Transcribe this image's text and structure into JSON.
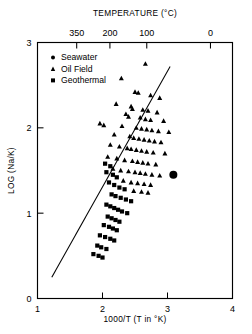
{
  "chart_data": {
    "type": "scatter",
    "title": "",
    "xlabel": "1000/T (T in °K)",
    "ylabel": "LOG (Na/K)",
    "top_axis_label": "TEMPERATURE (°C)",
    "xlim": [
      1,
      4
    ],
    "ylim": [
      0,
      3
    ],
    "grid": false,
    "legend_position": "top-left",
    "x_ticks": [
      {
        "value": 1,
        "label": "1"
      },
      {
        "value": 2,
        "label": "2"
      },
      {
        "value": 3,
        "label": "3"
      },
      {
        "value": 4,
        "label": "4"
      }
    ],
    "y_ticks": [
      {
        "value": 0,
        "label": "0"
      },
      {
        "value": 1,
        "label": "1"
      },
      {
        "value": 2,
        "label": "2"
      },
      {
        "value": 3,
        "label": "3"
      }
    ],
    "top_ticks": [
      {
        "x": 1.603,
        "label": "350"
      },
      {
        "x": 2.114,
        "label": "200"
      },
      {
        "x": 2.681,
        "label": "100"
      },
      {
        "x": 3.661,
        "label": "0"
      }
    ],
    "trendline": {
      "label": "fitted line",
      "x_start": 1.22,
      "y_start": 0.25,
      "x_end": 3.04,
      "y_end": 2.72
    },
    "series": [
      {
        "name": "Seawater",
        "marker": "circle",
        "points": [
          [
            3.09,
            1.45
          ]
        ]
      },
      {
        "name": "Oil Field",
        "marker": "triangle",
        "points": [
          [
            2.66,
            2.75
          ],
          [
            2.29,
            2.58
          ],
          [
            2.5,
            2.42
          ],
          [
            2.55,
            2.41
          ],
          [
            2.74,
            2.38
          ],
          [
            2.88,
            2.35
          ],
          [
            2.21,
            2.28
          ],
          [
            2.44,
            2.25
          ],
          [
            2.46,
            2.22
          ],
          [
            2.62,
            2.21
          ],
          [
            2.7,
            2.2
          ],
          [
            2.84,
            2.18
          ],
          [
            2.36,
            2.16
          ],
          [
            2.4,
            2.13
          ],
          [
            2.58,
            2.12
          ],
          [
            2.66,
            2.1
          ],
          [
            2.74,
            2.09
          ],
          [
            2.94,
            2.08
          ],
          [
            1.96,
            2.05
          ],
          [
            2.02,
            2.03
          ],
          [
            2.3,
            2.02
          ],
          [
            2.52,
            2.0
          ],
          [
            2.6,
            1.99
          ],
          [
            2.68,
            1.98
          ],
          [
            2.76,
            1.97
          ],
          [
            2.86,
            1.96
          ],
          [
            3.02,
            1.95
          ],
          [
            2.18,
            1.92
          ],
          [
            2.42,
            1.9
          ],
          [
            2.48,
            1.88
          ],
          [
            2.56,
            1.87
          ],
          [
            2.64,
            1.86
          ],
          [
            2.72,
            1.85
          ],
          [
            2.8,
            1.84
          ],
          [
            2.9,
            1.83
          ],
          [
            2.12,
            1.8
          ],
          [
            2.26,
            1.78
          ],
          [
            2.38,
            1.76
          ],
          [
            2.44,
            1.75
          ],
          [
            2.52,
            1.74
          ],
          [
            2.6,
            1.73
          ],
          [
            2.68,
            1.72
          ],
          [
            2.78,
            1.71
          ],
          [
            2.96,
            1.7
          ],
          [
            2.08,
            1.66
          ],
          [
            2.22,
            1.64
          ],
          [
            2.34,
            1.62
          ],
          [
            2.46,
            1.61
          ],
          [
            2.54,
            1.6
          ],
          [
            2.62,
            1.59
          ],
          [
            2.7,
            1.58
          ],
          [
            2.82,
            1.57
          ],
          [
            2.16,
            1.52
          ],
          [
            2.28,
            1.5
          ],
          [
            2.4,
            1.49
          ],
          [
            2.5,
            1.48
          ],
          [
            2.58,
            1.47
          ],
          [
            2.66,
            1.46
          ],
          [
            2.76,
            1.45
          ],
          [
            2.88,
            1.44
          ],
          [
            2.32,
            1.38
          ],
          [
            2.44,
            1.36
          ],
          [
            2.54,
            1.35
          ],
          [
            2.64,
            1.34
          ],
          [
            2.74,
            1.33
          ],
          [
            2.48,
            1.26
          ],
          [
            2.6,
            1.25
          ],
          [
            2.7,
            1.24
          ]
        ]
      },
      {
        "name": "Geothermal",
        "marker": "square",
        "points": [
          [
            2.04,
            1.58
          ],
          [
            2.12,
            1.55
          ],
          [
            2.06,
            1.48
          ],
          [
            2.16,
            1.45
          ],
          [
            2.22,
            1.42
          ],
          [
            2.1,
            1.36
          ],
          [
            2.18,
            1.33
          ],
          [
            2.26,
            1.3
          ],
          [
            2.34,
            1.28
          ],
          [
            2.14,
            1.22
          ],
          [
            2.2,
            1.2
          ],
          [
            2.28,
            1.18
          ],
          [
            2.36,
            1.16
          ],
          [
            2.44,
            1.14
          ],
          [
            2.06,
            1.1
          ],
          [
            2.12,
            1.08
          ],
          [
            2.18,
            1.06
          ],
          [
            2.24,
            1.04
          ],
          [
            2.3,
            1.02
          ],
          [
            2.38,
            1.0
          ],
          [
            2.08,
            0.96
          ],
          [
            2.14,
            0.94
          ],
          [
            2.2,
            0.92
          ],
          [
            2.26,
            0.9
          ],
          [
            2.02,
            0.86
          ],
          [
            2.1,
            0.84
          ],
          [
            2.16,
            0.82
          ],
          [
            2.22,
            0.8
          ],
          [
            1.96,
            0.74
          ],
          [
            2.04,
            0.72
          ],
          [
            2.12,
            0.7
          ],
          [
            2.18,
            0.68
          ],
          [
            1.92,
            0.62
          ],
          [
            1.98,
            0.6
          ],
          [
            2.06,
            0.58
          ],
          [
            1.86,
            0.52
          ],
          [
            1.94,
            0.5
          ],
          [
            2.0,
            0.48
          ]
        ]
      }
    ]
  },
  "legend": {
    "items": [
      {
        "label": "Seawater",
        "marker": "circle"
      },
      {
        "label": "Oil Field",
        "marker": "triangle"
      },
      {
        "label": "Geothermal",
        "marker": "square"
      }
    ]
  }
}
